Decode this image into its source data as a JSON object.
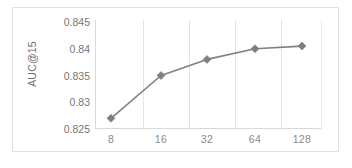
{
  "chart_data": {
    "type": "line",
    "title": "",
    "xlabel": "",
    "ylabel": "AUC@15",
    "categories": [
      "8",
      "16",
      "32",
      "64",
      "128"
    ],
    "values": [
      0.827,
      0.835,
      0.838,
      0.84,
      0.8405
    ],
    "series": [
      {
        "name": "AUC@15",
        "values": [
          0.827,
          0.835,
          0.838,
          0.84,
          0.8405
        ]
      }
    ],
    "ylim": [
      0.825,
      0.845
    ],
    "ytick_labels": [
      "0.845",
      "0.84",
      "0.835",
      "0.83",
      "0.825"
    ],
    "ytick_values": [
      0.845,
      0.84,
      0.835,
      0.83,
      0.825
    ],
    "xtick_labels": [
      "8",
      "16",
      "32",
      "64",
      "128"
    ],
    "grid": "vertical",
    "legend": "none",
    "marker": "diamond",
    "colors": {
      "series_line": "#808080",
      "marker": "#7f7f7f",
      "gridline": "#e4e4e4",
      "axis": "#d9d9d9",
      "tick_label": "#767676",
      "axis_title": "#6e6e6e",
      "frame": "#e2e2e2",
      "background": "#ffffff"
    }
  },
  "axes": {
    "y_title": "AUC@15",
    "y_ticks": [
      {
        "label": "0.845"
      },
      {
        "label": "0.84"
      },
      {
        "label": "0.835"
      },
      {
        "label": "0.83"
      },
      {
        "label": "0.825"
      }
    ],
    "x_ticks": [
      {
        "label": "8"
      },
      {
        "label": "16"
      },
      {
        "label": "32"
      },
      {
        "label": "64"
      },
      {
        "label": "128"
      }
    ]
  }
}
